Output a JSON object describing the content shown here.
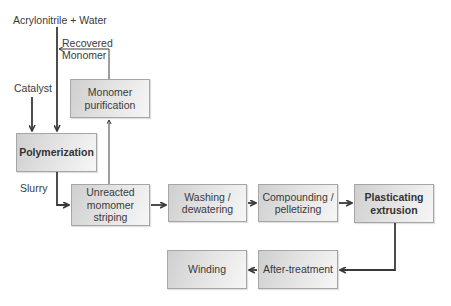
{
  "diagram": {
    "inputs": {
      "feed": "Acrylonitrile + Water",
      "catalyst": "Catalyst",
      "recovered": "Recovered Monomer",
      "recovered_line1": "Recovered",
      "recovered_line2": "Monomer",
      "slurry": "Slurry"
    },
    "nodes": [
      {
        "id": "polymerization",
        "label": "Polymerization",
        "bold": true
      },
      {
        "id": "monomer_purification",
        "label": "Monomer purification",
        "line1": "Monomer",
        "line2": "purification",
        "bold": false
      },
      {
        "id": "unreacted_stripping",
        "label": "Unreacted momomer striping",
        "line1": "Unreacted",
        "line2": "momomer",
        "line3": "striping",
        "bold": false
      },
      {
        "id": "washing",
        "label": "Washing / dewatering",
        "line1": "Washing /",
        "line2": "dewatering",
        "bold": false
      },
      {
        "id": "compounding",
        "label": "Compounding / pelletizing",
        "line1": "Compounding /",
        "line2": "pelletizing",
        "bold": false
      },
      {
        "id": "plasticating",
        "label": "Plasticating extrusion",
        "line1": "Plasticating",
        "line2": "extrusion",
        "bold": true
      },
      {
        "id": "after_treatment",
        "label": "After-treatment",
        "bold": false
      },
      {
        "id": "winding",
        "label": "Winding",
        "bold": false
      }
    ],
    "edges": [
      {
        "from": "Acrylonitrile + Water",
        "to": "polymerization"
      },
      {
        "from": "Catalyst",
        "to": "polymerization"
      },
      {
        "from": "polymerization",
        "to": "unreacted_stripping",
        "label": "Slurry"
      },
      {
        "from": "unreacted_stripping",
        "to": "monomer_purification"
      },
      {
        "from": "monomer_purification",
        "to": "Acrylonitrile + Water line",
        "label": "Recovered Monomer"
      },
      {
        "from": "unreacted_stripping",
        "to": "washing"
      },
      {
        "from": "washing",
        "to": "compounding"
      },
      {
        "from": "compounding",
        "to": "plasticating"
      },
      {
        "from": "plasticating",
        "to": "after_treatment"
      },
      {
        "from": "after_treatment",
        "to": "winding"
      }
    ],
    "colors": {
      "box_border": "#a6a6a6",
      "box_fill_dark": "#cfcfcf",
      "box_fill_light": "#f6f6f6",
      "connector": "#3a3a3a",
      "text": "#333333"
    }
  }
}
